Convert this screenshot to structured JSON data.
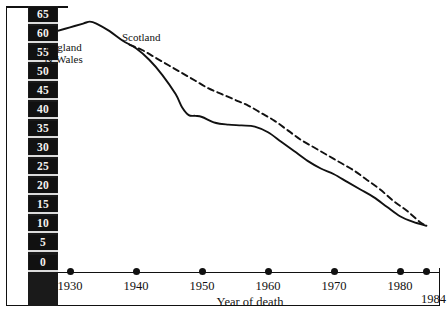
{
  "axes": {
    "y_title": "Perinatal deaths per 1000 total births",
    "x_title": "Year of death",
    "y_ticks": [
      65,
      60,
      55,
      50,
      45,
      40,
      35,
      30,
      25,
      20,
      15,
      10,
      5,
      0
    ],
    "x_ticks": [
      1930,
      1940,
      1950,
      1960,
      1970,
      1980
    ],
    "x_end_tick": 1984
  },
  "series_labels": {
    "england_wales_line1": "England",
    "england_wales_line2": "& Wales",
    "scotland": "Scotland"
  },
  "chart_data": {
    "type": "line",
    "title": "",
    "xlabel": "Year of death",
    "ylabel": "Perinatal deaths per 1000 total births",
    "xlim": [
      1928,
      1984
    ],
    "ylim": [
      0,
      67
    ],
    "grid": false,
    "legend": "in-plot labels",
    "series": [
      {
        "name": "England & Wales",
        "style": "solid",
        "x": [
          1928,
          1930,
          1932,
          1933,
          1934,
          1936,
          1938,
          1940,
          1942,
          1944,
          1946,
          1947,
          1948,
          1949,
          1950,
          1952,
          1954,
          1956,
          1958,
          1960,
          1962,
          1964,
          1966,
          1968,
          1970,
          1972,
          1974,
          1976,
          1978,
          1980,
          1982,
          1984
        ],
        "values": [
          60.5,
          61.5,
          62.5,
          63.0,
          62.5,
          60.5,
          58.0,
          56.0,
          53.0,
          49.0,
          44.0,
          40.5,
          38.5,
          38.3,
          38.0,
          36.5,
          36.0,
          35.8,
          35.5,
          34.0,
          31.5,
          29.0,
          26.5,
          24.5,
          23.0,
          21.0,
          19.0,
          17.0,
          14.5,
          12.0,
          10.5,
          9.5
        ]
      },
      {
        "name": "Scotland",
        "style": "dashed",
        "x": [
          1939,
          1941,
          1943,
          1945,
          1947,
          1949,
          1951,
          1953,
          1955,
          1957,
          1959,
          1961,
          1963,
          1965,
          1967,
          1969,
          1971,
          1973,
          1975,
          1977,
          1979,
          1981,
          1983,
          1984
        ],
        "values": [
          57.0,
          55.5,
          53.5,
          51.5,
          49.5,
          47.5,
          45.5,
          44.0,
          42.5,
          41.0,
          39.0,
          37.0,
          34.5,
          32.0,
          30.0,
          28.0,
          26.0,
          24.0,
          21.5,
          19.0,
          16.0,
          13.5,
          10.5,
          9.5
        ]
      }
    ]
  }
}
